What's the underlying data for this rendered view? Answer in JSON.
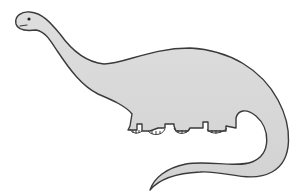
{
  "image": {
    "subject": "Cartoon long-necked dinosaur (sauropod)",
    "colors": {
      "background": "#ffffff",
      "body_fill": "#d9d9d9",
      "outline": "#3a3a3a",
      "eye": "#222222"
    }
  }
}
